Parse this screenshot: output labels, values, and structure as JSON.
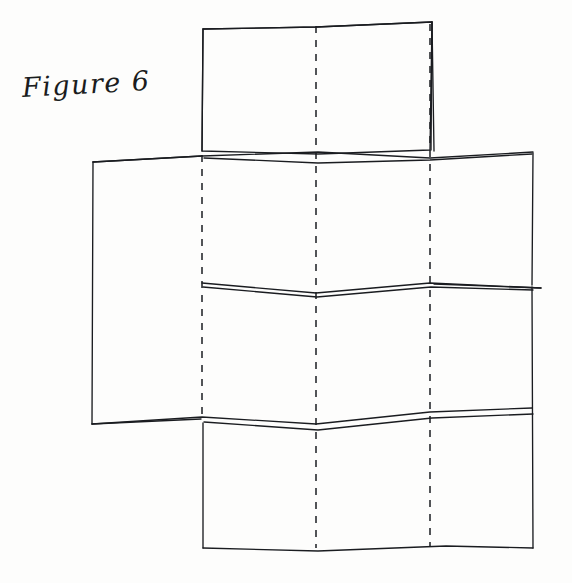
{
  "page": {
    "width": 572,
    "height": 583,
    "background_color": "#fdfdfc",
    "ink_color": "#1a1c20"
  },
  "caption": {
    "text": "Figure 6",
    "label": "figure-caption",
    "position": {
      "x": 22,
      "y": 72
    },
    "rotation_deg": -3.2
  },
  "diagram": {
    "name": "folded-paper-diagram",
    "style": {
      "stroke": "#1a1c20",
      "stroke_width": 1.35,
      "dash_pattern": "7 7",
      "dash_stroke_width": 1.5,
      "fill": "none"
    },
    "solid_edges": [
      {
        "name": "top-panel-outline",
        "points": "203,29 202,151 318,154 430,150 432,22 316,27 203,29"
      },
      {
        "name": "top-panel-left-edge",
        "points": "203,29 202,151"
      },
      {
        "name": "top-panel-top-edge",
        "points": "203,29 316,27 432,22"
      },
      {
        "name": "top-panel-right-edge",
        "points": "432,22 431,150"
      },
      {
        "name": "left-panel-left-edge",
        "points": "93,162 92,424"
      },
      {
        "name": "left-panel-top-edge",
        "points": "93,162 202,156"
      },
      {
        "name": "left-panel-bottom-edge",
        "points": "92,424 201,419"
      },
      {
        "name": "right-panel-upper-right-edge",
        "points": "432,22 434,151"
      },
      {
        "name": "right-panel-right-edge",
        "points": "533,153 532,285"
      },
      {
        "name": "right-panel-lower-right-edge",
        "points": "532,287 533,548"
      },
      {
        "name": "bottom-panel-left-edge",
        "points": "203,423 203,548"
      },
      {
        "name": "bottom-panel-bottom-edge",
        "points": "203,548 318,551 446,546 533,548"
      },
      {
        "name": "fold-ridge-upper",
        "points": "93,162 202,156 318,152 430,158 533,152"
      },
      {
        "name": "fold-ridge-upper-second",
        "points": "204,158 318,163 430,160 532,154"
      },
      {
        "name": "fold-ridge-middle",
        "points": "202,283 316,293 430,283 541,288"
      },
      {
        "name": "fold-ridge-middle-second",
        "points": "203,287 317,297 431,287 533,290"
      },
      {
        "name": "fold-ridge-lower",
        "points": "92,424 202,417 316,424 430,412 532,408"
      },
      {
        "name": "fold-ridge-lower-second",
        "points": "204,422 318,430 432,418 533,414"
      },
      {
        "name": "right-stray-line",
        "points": "434,284 541,288"
      }
    ],
    "dashed_fold_lines": [
      {
        "name": "fold-line-left",
        "x": 202,
        "y_start": 155,
        "y_end": 421
      },
      {
        "name": "fold-line-center",
        "x": 316,
        "y_start": 26,
        "y_end": 548
      },
      {
        "name": "fold-line-right",
        "x": 430,
        "y_start": 24,
        "y_end": 546
      }
    ]
  }
}
